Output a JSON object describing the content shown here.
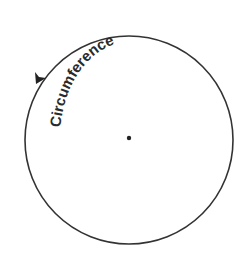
{
  "diagram": {
    "label": "Circumference",
    "colors": {
      "stroke": "#333333",
      "text": "#2a2a2a",
      "background": "#ffffff"
    }
  }
}
